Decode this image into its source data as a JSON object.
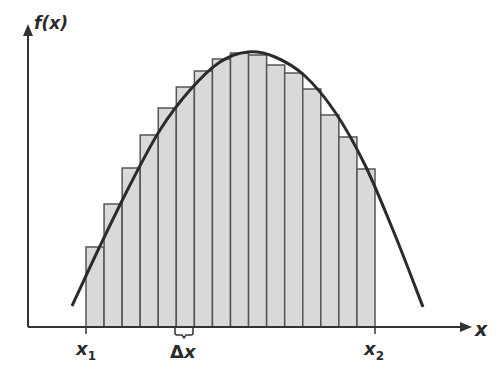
{
  "diagram": {
    "y_axis_label": "f(x)",
    "x_axis_label": "x",
    "left_bound_label": {
      "base": "x",
      "sub": "1"
    },
    "right_bound_label": {
      "base": "x",
      "sub": "2"
    },
    "width_label": {
      "delta": "Δ",
      "var": "x"
    },
    "colors": {
      "axis": "#333333",
      "curve": "#2b2b2b",
      "bar_fill": "#d9d9d9",
      "bar_stroke": "#555555",
      "background": "#ffffff"
    }
  },
  "chart_data": {
    "type": "bar",
    "title": "",
    "xlabel": "x",
    "ylabel": "f(x)",
    "num_rectangles": 16,
    "x_range_px": [
      86,
      375
    ],
    "axis_baseline_px": 327,
    "rect_top_px": [
      247,
      204,
      168,
      135,
      108,
      87,
      71,
      59,
      53,
      55,
      65,
      73,
      89,
      115,
      137,
      169
    ],
    "curve_points_px": [
      [
        72,
        306
      ],
      [
        100,
        246
      ],
      [
        130,
        185
      ],
      [
        160,
        130
      ],
      [
        190,
        90
      ],
      [
        220,
        62
      ],
      [
        248,
        52
      ],
      [
        275,
        57
      ],
      [
        305,
        76
      ],
      [
        335,
        112
      ],
      [
        365,
        165
      ],
      [
        395,
        235
      ],
      [
        423,
        307
      ]
    ],
    "ticks": [
      "x1",
      "Δx",
      "x2"
    ],
    "grid": false
  }
}
